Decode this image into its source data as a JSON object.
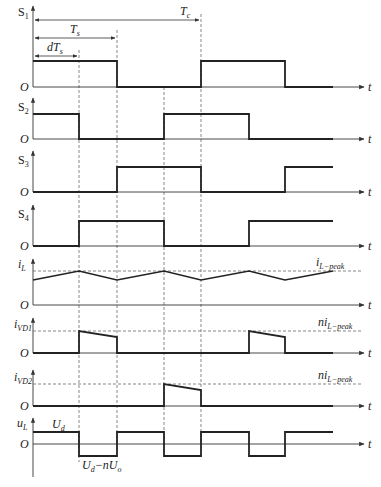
{
  "colors": {
    "line": "#222222",
    "axis": "#333333",
    "dash": "#555555",
    "background": "#ffffff"
  },
  "time_marks": {
    "t0": 33,
    "t1": 79,
    "t2": 117,
    "t3": 164,
    "t4": 201,
    "t5": 249,
    "t6": 285,
    "t_end": 333,
    "axis_end": 364
  },
  "dimensions": [
    {
      "id": "Tc",
      "label_main": "T",
      "label_sub": "c",
      "from": "t0",
      "to": "t4",
      "y": 20
    },
    {
      "id": "Ts",
      "label_main": "T",
      "label_sub": "s",
      "from": "t0",
      "to": "t2",
      "y": 38
    },
    {
      "id": "dTs",
      "label_main": "dT",
      "label_sub": "s",
      "from": "t0",
      "to": "t1",
      "y": 56
    }
  ],
  "traces": [
    {
      "id": "S1",
      "label_main": "S",
      "label_sub": "1",
      "italic": false,
      "baseline_y": 87,
      "high_y": 61,
      "segments": "high 0-Ts, low Ts-Tc, high Tc-t6, low t6-end"
    },
    {
      "id": "S2",
      "label_main": "S",
      "label_sub": "2",
      "italic": false,
      "baseline_y": 139,
      "high_y": 114,
      "segments": "high 0-t1, low t1-t3, high t3-t6? high t3-t5(? ) "
    },
    {
      "id": "S3",
      "label_main": "S",
      "label_sub": "3",
      "italic": false,
      "baseline_y": 192,
      "high_y": 167
    },
    {
      "id": "S4",
      "label_main": "S",
      "label_sub": "4",
      "italic": false,
      "baseline_y": 246,
      "high_y": 221
    },
    {
      "id": "iL",
      "label_main": "i",
      "label_sub": "L",
      "italic": true,
      "baseline_y": 305,
      "peak_y": 271,
      "trough_y": 280,
      "ref_label_main": "i",
      "ref_label_sub": "L−peak"
    },
    {
      "id": "iVD1",
      "label_main": "i",
      "label_sub": "VD1",
      "italic": true,
      "baseline_y": 353,
      "peak_y": 331,
      "droop_y": 337,
      "ref_label_prefix": "n",
      "ref_label_main": "i",
      "ref_label_sub": "L−peak"
    },
    {
      "id": "iVD2",
      "label_main": "i",
      "label_sub": "VD2",
      "italic": true,
      "baseline_y": 406,
      "peak_y": 384,
      "droop_y": 390,
      "ref_label_prefix": "n",
      "ref_label_main": "i",
      "ref_label_sub": "L−peak"
    },
    {
      "id": "uL",
      "label_main": "u",
      "label_sub": "L",
      "italic": true,
      "baseline_y": 444,
      "high_y": 432,
      "low_y": 456,
      "high_label_main": "U",
      "high_label_sub": "d",
      "low_label": "U_d−nU_o"
    }
  ],
  "labels": {
    "origin": "O",
    "time_axis": "t",
    "ud_main": "U",
    "ud_sub": "d",
    "low_main_1": "U",
    "low_sub_1": "d",
    "low_minus": "−n",
    "low_main_2": "U",
    "low_sub_2": "o"
  }
}
